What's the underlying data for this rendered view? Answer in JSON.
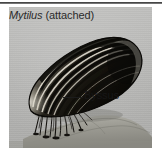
{
  "figure": {
    "panel_background": "#b9b9b7",
    "caption": {
      "genus": "Mytilus",
      "state": " (attached)",
      "full": "Mytilus (attached)"
    },
    "labels": [
      {
        "name": "byssus",
        "text": "Byssus",
        "leader_line": true
      }
    ],
    "subject": {
      "organism": "mussel",
      "shell_color": "#17150f",
      "shell_highlight": "#e8e4da",
      "rock_color": "#9b9a93",
      "byssus_color": "#141210"
    },
    "rule_color": "#3a3a3a"
  }
}
